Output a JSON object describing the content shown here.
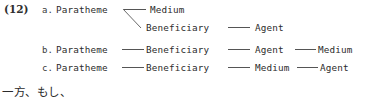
{
  "colors": {
    "background": "#ffffff",
    "text": "#2b2b2b",
    "line": "#555555"
  },
  "example": {
    "number_label": "(12)",
    "items": [
      {
        "letter": "a.",
        "type": "branching",
        "head": "Paratheme",
        "top_branch": "Medium",
        "lower_branch": [
          "Beneficiary",
          "Agent"
        ]
      },
      {
        "letter": "b.",
        "type": "chain",
        "nodes": [
          "Paratheme",
          "Beneficiary",
          "Agent",
          "Medium"
        ]
      },
      {
        "letter": "c.",
        "type": "chain",
        "nodes": [
          "Paratheme",
          "Beneficiary",
          "Medium",
          "Agent"
        ]
      }
    ]
  },
  "running_text": "一方、もし、"
}
